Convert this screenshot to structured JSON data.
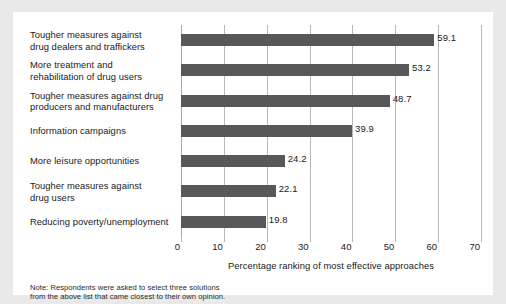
{
  "chart_data": {
    "type": "bar",
    "orientation": "horizontal",
    "title": "",
    "xlabel": "Percentage ranking of most effective approaches",
    "ylabel": "",
    "xlim": [
      0,
      70
    ],
    "xticks": [
      0,
      10,
      20,
      30,
      40,
      50,
      60,
      70
    ],
    "xtick_labels": [
      "0",
      "10",
      "20",
      "30",
      "40",
      "50",
      "60",
      "70"
    ],
    "grid": true,
    "legend": "none",
    "categories": [
      "Tougher measures against drug dealers and traffickers",
      "More treatment and rehabilitation of drug users",
      "Tougher measures against drug producers and manufacturers",
      "Information campaigns",
      "More leisure opportunities",
      "Tougher measures against drug users",
      "Reducing poverty/unemployment"
    ],
    "values": [
      59.1,
      53.2,
      48.7,
      39.9,
      24.2,
      22.1,
      19.8
    ],
    "value_labels": [
      "59.1",
      "53.2",
      "48.7",
      "39.9",
      "24.2",
      "22.1",
      "19.8"
    ],
    "bar_color": "#58585a",
    "gridline_color": "#b8b8b8"
  },
  "category_lines": [
    [
      "Tougher measures against",
      "drug dealers and traffickers"
    ],
    [
      "More treatment and",
      "rehabilitation of drug users"
    ],
    [
      "Tougher measures against drug",
      "producers and manufacturers"
    ],
    [
      "Information campaigns"
    ],
    [
      "More leisure opportunities"
    ],
    [
      "Tougher measures against",
      "drug users"
    ],
    [
      "Reducing poverty/unemployment"
    ]
  ],
  "note": {
    "line1": "Note: Respondents were asked to select three solutions",
    "line2": "from the above list that came closest to their own opinion."
  }
}
